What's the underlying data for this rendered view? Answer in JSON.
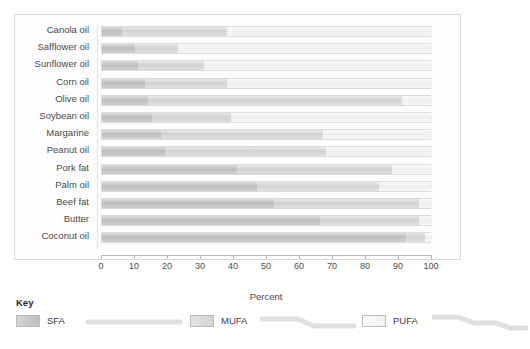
{
  "chart_data": {
    "type": "bar",
    "orientation": "horizontal",
    "stacked": true,
    "title": "",
    "xlabel": "Percent",
    "ylabel": "",
    "xlim": [
      0,
      100
    ],
    "xticks": [
      0,
      10,
      20,
      30,
      40,
      50,
      60,
      70,
      80,
      90,
      100
    ],
    "grid": false,
    "legend_position": "bottom",
    "categories": [
      "Canola oil",
      "Safflower oil",
      "Sunflower oil",
      "Corn oil",
      "Olive oil",
      "Soybean oil",
      "Margarine",
      "Peanut oil",
      "Pork fat",
      "Palm oil",
      "Beef fat",
      "Butter",
      "Coconut oil"
    ],
    "series": [
      {
        "name": "SFA",
        "color": "#c4c4c4",
        "values": [
          6,
          10,
          11,
          13,
          14,
          15,
          18,
          19,
          41,
          47,
          52,
          66,
          92
        ]
      },
      {
        "name": "MUFA",
        "color": "#dcdcdc",
        "values": [
          32,
          13,
          20,
          25,
          77,
          24,
          49,
          49,
          47,
          37,
          44,
          30,
          6
        ]
      },
      {
        "name": "PUFA",
        "color": "#f2f2f2",
        "values": [
          62,
          77,
          69,
          62,
          9,
          61,
          33,
          32,
          12,
          16,
          4,
          4,
          2
        ]
      }
    ]
  },
  "legend": {
    "title": "Key",
    "items": [
      {
        "label": "SFA",
        "icon": "straight-chain-icon"
      },
      {
        "label": "MUFA",
        "icon": "one-kink-chain-icon"
      },
      {
        "label": "PUFA",
        "icon": "two-kink-chain-icon"
      }
    ]
  },
  "colors": {
    "panel_border": "#d9d9d9",
    "axis": "#b9b9b9",
    "text": "#4a4a4a"
  }
}
